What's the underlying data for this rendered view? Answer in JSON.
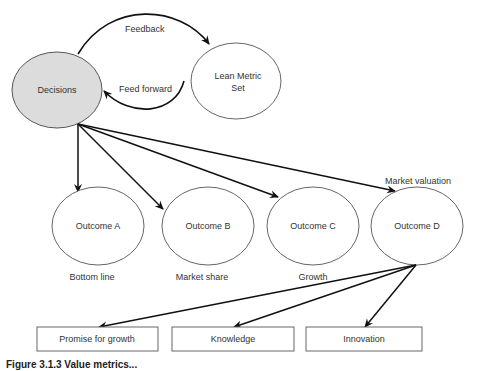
{
  "diagram": {
    "nodes": {
      "decisions": {
        "label": "Decisions",
        "fill": "#dcdcdc"
      },
      "lean_metric_set": {
        "label_line1": "Lean Metric",
        "label_line2": "Set"
      },
      "outcome_a": {
        "label": "Outcome A",
        "sublabel": "Bottom line"
      },
      "outcome_b": {
        "label": "Outcome B",
        "sublabel": "Market share"
      },
      "outcome_c": {
        "label": "Outcome C",
        "sublabel": "Growth"
      },
      "outcome_d": {
        "label": "Outcome D",
        "sublabel": "Market valuation"
      },
      "box_promise": {
        "label": "Promise for growth"
      },
      "box_knowledge": {
        "label": "Knowledge"
      },
      "box_innovation": {
        "label": "Innovation"
      }
    },
    "edges": {
      "feedback": {
        "label": "Feedback"
      },
      "feed_forward": {
        "label": "Feed forward"
      }
    },
    "caption": "Figure 3.1.3 Value metrics..."
  }
}
